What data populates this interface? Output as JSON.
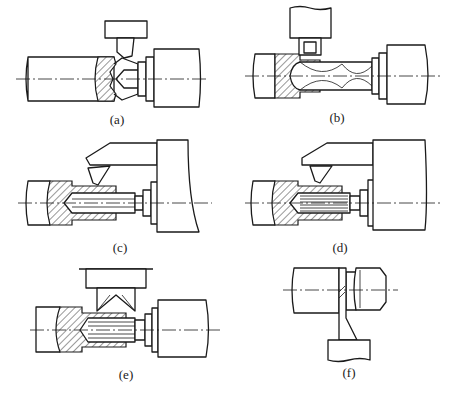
{
  "figure": {
    "panels": [
      {
        "id": "a",
        "label": "(a)",
        "operation": "face turning / chamfering with tool from above"
      },
      {
        "id": "b",
        "label": "(b)",
        "operation": "drilling with twist drill, grooving tool from above"
      },
      {
        "id": "c",
        "label": "(c)",
        "operation": "reaming / boring with tool from upper carriage"
      },
      {
        "id": "d",
        "label": "(d)",
        "operation": "broaching-style internal operation with tool from upper carriage"
      },
      {
        "id": "e",
        "label": "(e)",
        "operation": "internal operation with double-angle tool from above"
      },
      {
        "id": "f",
        "label": "(f)",
        "operation": "parting off with tool from below"
      }
    ],
    "colors": {
      "line": "#1a1a1a",
      "background": "#ffffff"
    }
  }
}
